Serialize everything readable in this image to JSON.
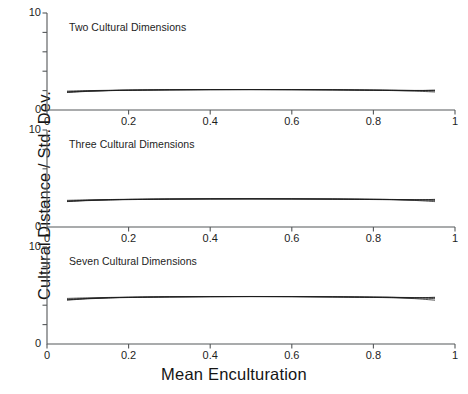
{
  "figure": {
    "xlabel": "Mean Enculturation",
    "ylabel": "Cultural Distance / Std. Dev."
  },
  "chart_data": {
    "type": "line",
    "title": "",
    "xlabel": "Mean Enculturation",
    "ylabel": "Cultural Distance / Std. Dev.",
    "xlim": [
      0,
      1
    ],
    "ylim": [
      0,
      10
    ],
    "grid": false,
    "legend": "none",
    "xticks": [
      0,
      0.2,
      0.4,
      0.6,
      0.8,
      1
    ],
    "xtick_labels": [
      "0",
      "0.2",
      "0.4",
      "0.6",
      "0.8",
      "1"
    ],
    "yticks": [
      0,
      2,
      4,
      6,
      8,
      10
    ],
    "ytick_labels": [
      "0",
      "",
      "",
      "",
      "",
      "10"
    ],
    "panels": [
      {
        "label": "Two Cultural Dimensions",
        "x": [
          0.05,
          0.1,
          0.15,
          0.2,
          0.3,
          0.4,
          0.5,
          0.6,
          0.7,
          0.8,
          0.85,
          0.9,
          0.95
        ],
        "series": [
          {
            "name": "run-1",
            "values": [
              1.8,
              1.92,
              1.99,
              2.03,
              2.07,
              2.09,
              2.1,
              2.09,
              2.07,
              2.03,
              2.0,
              1.95,
              1.86
            ]
          },
          {
            "name": "run-2",
            "values": [
              1.95,
              2.0,
              2.03,
              2.06,
              2.09,
              2.11,
              2.11,
              2.1,
              2.09,
              2.06,
              2.04,
              2.01,
              1.97
            ]
          },
          {
            "name": "run-3",
            "values": [
              1.88,
              1.96,
              2.01,
              2.04,
              2.08,
              2.1,
              2.1,
              2.1,
              2.08,
              2.04,
              2.02,
              1.99,
              2.05
            ]
          },
          {
            "name": "run-4",
            "values": [
              1.84,
              1.94,
              2.0,
              2.04,
              2.08,
              2.1,
              2.11,
              2.1,
              2.08,
              2.05,
              2.03,
              2.02,
              2.02
            ]
          }
        ]
      },
      {
        "label": "Three Cultural Dimensions",
        "x": [
          0.05,
          0.1,
          0.15,
          0.2,
          0.3,
          0.4,
          0.5,
          0.6,
          0.7,
          0.8,
          0.85,
          0.9,
          0.95
        ],
        "series": [
          {
            "name": "run-1",
            "values": [
              2.62,
              2.72,
              2.78,
              2.82,
              2.87,
              2.89,
              2.9,
              2.89,
              2.87,
              2.83,
              2.8,
              2.74,
              2.62
            ]
          },
          {
            "name": "run-2",
            "values": [
              2.75,
              2.8,
              2.83,
              2.86,
              2.89,
              2.91,
              2.91,
              2.9,
              2.89,
              2.86,
              2.84,
              2.8,
              2.74
            ]
          },
          {
            "name": "run-3",
            "values": [
              2.68,
              2.76,
              2.81,
              2.84,
              2.88,
              2.9,
              2.9,
              2.9,
              2.88,
              2.85,
              2.83,
              2.79,
              2.85
            ]
          },
          {
            "name": "run-4",
            "values": [
              2.64,
              2.74,
              2.8,
              2.84,
              2.88,
              2.9,
              2.91,
              2.9,
              2.88,
              2.85,
              2.83,
              2.82,
              2.81
            ]
          }
        ]
      },
      {
        "label": "Seven Cultural Dimensions",
        "x": [
          0.05,
          0.1,
          0.15,
          0.2,
          0.3,
          0.4,
          0.5,
          0.6,
          0.7,
          0.8,
          0.85,
          0.9,
          0.95
        ],
        "series": [
          {
            "name": "run-1",
            "values": [
              4.52,
              4.66,
              4.74,
              4.79,
              4.85,
              4.88,
              4.89,
              4.88,
              4.85,
              4.8,
              4.76,
              4.68,
              4.52
            ]
          },
          {
            "name": "run-2",
            "values": [
              4.7,
              4.76,
              4.8,
              4.83,
              4.87,
              4.89,
              4.9,
              4.89,
              4.87,
              4.84,
              4.81,
              4.76,
              4.68
            ]
          },
          {
            "name": "run-3",
            "values": [
              4.6,
              4.7,
              4.77,
              4.81,
              4.86,
              4.88,
              4.89,
              4.88,
              4.86,
              4.82,
              4.8,
              4.75,
              4.82
            ]
          },
          {
            "name": "run-4",
            "values": [
              4.56,
              4.68,
              4.76,
              4.81,
              4.86,
              4.88,
              4.89,
              4.89,
              4.86,
              4.83,
              4.81,
              4.79,
              4.78
            ]
          }
        ]
      }
    ]
  }
}
